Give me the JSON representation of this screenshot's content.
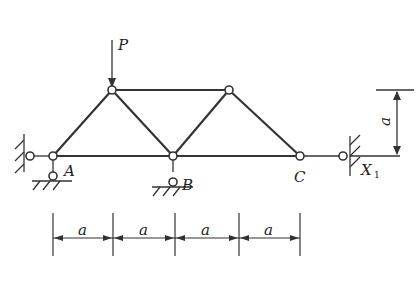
{
  "diagram": {
    "type": "truss",
    "load_label": "P",
    "nodes": {
      "A": "A",
      "B": "B",
      "C": "C"
    },
    "redundant_label": "X",
    "redundant_sub": "1",
    "height_label": "a",
    "span_labels": [
      "a",
      "a",
      "a",
      "a"
    ]
  }
}
